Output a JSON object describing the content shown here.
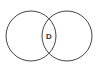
{
  "diagram": {
    "type": "venn",
    "sets": [
      {
        "name": "left-set",
        "cx": 31,
        "cy": 36,
        "r": 25
      },
      {
        "name": "right-set",
        "cx": 67,
        "cy": 36,
        "r": 25
      }
    ],
    "intersection_label": "D",
    "stroke_color": "#444444"
  }
}
